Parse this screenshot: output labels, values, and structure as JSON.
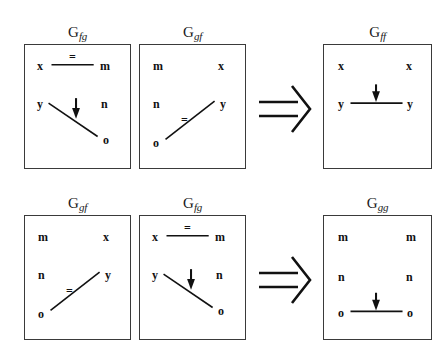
{
  "figure": {
    "caption_symbols": {
      "implication": "⟹",
      "equality": "=",
      "arrow_down": "↓"
    },
    "rows": [
      {
        "row_id": "row-1",
        "operator": "⟹",
        "operands": [
          {
            "id": "g-fg-top",
            "label_base": "G",
            "label_sub": "fg",
            "nodes": [
              {
                "name": "x",
                "pos": "top-left"
              },
              {
                "name": "m",
                "pos": "top-right"
              },
              {
                "name": "y",
                "pos": "mid-left"
              },
              {
                "name": "n",
                "pos": "mid-right"
              },
              {
                "name": "o",
                "pos": "bottom-right"
              }
            ],
            "edges": [
              {
                "from": "x",
                "to": "m",
                "kind": "equality",
                "marker": "="
              },
              {
                "from": "y",
                "to": "o",
                "kind": "directed",
                "marker": "↓"
              }
            ]
          },
          {
            "id": "g-gf-top",
            "label_base": "G",
            "label_sub": "gf",
            "nodes": [
              {
                "name": "m",
                "pos": "top-left"
              },
              {
                "name": "x",
                "pos": "top-right"
              },
              {
                "name": "n",
                "pos": "mid-left"
              },
              {
                "name": "y",
                "pos": "mid-right"
              },
              {
                "name": "o",
                "pos": "bottom-left"
              }
            ],
            "edges": [
              {
                "from": "o",
                "to": "y",
                "kind": "equality",
                "marker": "="
              }
            ]
          }
        ],
        "result": {
          "id": "g-ff",
          "label_base": "G",
          "label_sub": "ff",
          "nodes": [
            {
              "name": "x",
              "pos": "top-left"
            },
            {
              "name": "x",
              "pos": "top-right"
            },
            {
              "name": "y",
              "pos": "mid-left"
            },
            {
              "name": "y",
              "pos": "mid-right"
            }
          ],
          "edges": [
            {
              "from": "y",
              "to": "y",
              "kind": "directed",
              "marker": "↓"
            }
          ]
        }
      },
      {
        "row_id": "row-2",
        "operator": "⟹",
        "operands": [
          {
            "id": "g-gf-bottom",
            "label_base": "G",
            "label_sub": "gf",
            "nodes": [
              {
                "name": "m",
                "pos": "top-left"
              },
              {
                "name": "x",
                "pos": "top-right"
              },
              {
                "name": "n",
                "pos": "mid-left"
              },
              {
                "name": "y",
                "pos": "mid-right"
              },
              {
                "name": "o",
                "pos": "bottom-left"
              }
            ],
            "edges": [
              {
                "from": "o",
                "to": "y",
                "kind": "equality",
                "marker": "="
              }
            ]
          },
          {
            "id": "g-fg-bottom",
            "label_base": "G",
            "label_sub": "fg",
            "nodes": [
              {
                "name": "x",
                "pos": "top-left"
              },
              {
                "name": "m",
                "pos": "top-right"
              },
              {
                "name": "y",
                "pos": "mid-left"
              },
              {
                "name": "n",
                "pos": "mid-right"
              },
              {
                "name": "o",
                "pos": "bottom-right"
              }
            ],
            "edges": [
              {
                "from": "x",
                "to": "m",
                "kind": "equality",
                "marker": "="
              },
              {
                "from": "y",
                "to": "o",
                "kind": "directed",
                "marker": "↓"
              }
            ]
          }
        ],
        "result": {
          "id": "g-gg",
          "label_base": "G",
          "label_sub": "gg",
          "nodes": [
            {
              "name": "m",
              "pos": "top-left"
            },
            {
              "name": "m",
              "pos": "top-right"
            },
            {
              "name": "n",
              "pos": "mid-left"
            },
            {
              "name": "n",
              "pos": "mid-right"
            },
            {
              "name": "o",
              "pos": "bottom-left"
            },
            {
              "name": "o",
              "pos": "bottom-right"
            }
          ],
          "edges": [
            {
              "from": "o",
              "to": "o",
              "kind": "directed",
              "marker": "↓"
            }
          ]
        }
      }
    ]
  }
}
